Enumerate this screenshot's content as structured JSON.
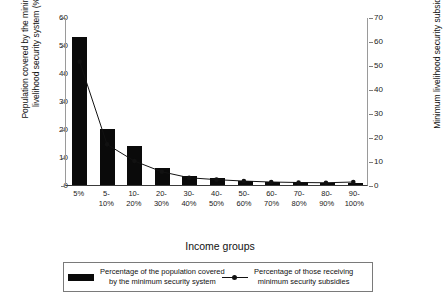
{
  "chart_data": {
    "type": "bar",
    "title": "",
    "xlabel": "Income groups",
    "ylabel": "Population covered by the minimum livelihood security system (%)",
    "y2label": "Minimum livelihood security subsidy (%)",
    "categories": [
      "5%",
      "5-10%",
      "10-20%",
      "20-30%",
      "30-40%",
      "40-50%",
      "50-60%",
      "60-70%",
      "70-80%",
      "80-90%",
      "90-100%"
    ],
    "ylim": [
      0,
      60
    ],
    "y2lim": [
      0,
      70
    ],
    "yticks": [
      0,
      10,
      20,
      30,
      40,
      50,
      60
    ],
    "y2ticks": [
      0,
      10,
      20,
      30,
      40,
      50,
      60,
      70
    ],
    "grid": false,
    "legend_position": "bottom",
    "series": [
      {
        "name": "Percentage of the population covered\nby the minimum security system",
        "type": "bar",
        "axis": "left",
        "values": [
          53.0,
          20.0,
          13.8,
          6.0,
          3.2,
          2.4,
          1.5,
          1.1,
          0.9,
          0.7,
          0.6
        ]
      },
      {
        "name": "Percentage of those receiving\nminimum security subsidies",
        "type": "line",
        "axis": "right",
        "values": [
          51.7,
          17.0,
          10.0,
          5.5,
          3.0,
          2.2,
          1.6,
          1.2,
          1.0,
          0.9,
          1.2
        ]
      }
    ]
  },
  "axes": {
    "left_title": "Population covered by the minimum livelihood security system (%)",
    "right_title": "Minimum livelihood security subsidy (%)",
    "x_title": "Income groups"
  },
  "legend": {
    "entries": [
      {
        "label": "Percentage of the population covered\nby the minimum security system",
        "marker": "bar"
      },
      {
        "label": "Percentage of those receiving\nminimum security subsidies",
        "marker": "line"
      }
    ]
  },
  "colors": {
    "bar": "#0a0a0a",
    "line": "#111111",
    "axis": "#7d7d7d",
    "background": "#ffffff"
  }
}
